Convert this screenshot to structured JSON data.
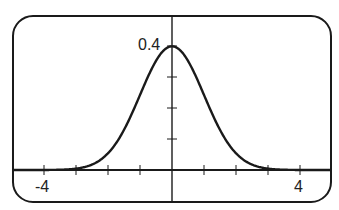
{
  "chart_data": {
    "type": "line",
    "title": "",
    "xlabel": "",
    "ylabel": "",
    "function": "standard normal probability density, y = (1/sqrt(2*pi)) * exp(-x^2/2)",
    "xlim": [
      -5,
      5
    ],
    "ylim": [
      -0.1,
      0.5
    ],
    "x_ticks": [
      -4,
      -3,
      -2,
      -1,
      0,
      1,
      2,
      3,
      4
    ],
    "y_ticks": [
      0.1,
      0.2,
      0.3,
      0.4
    ],
    "tick_labels": {
      "x_min": "-4",
      "x_max": "4",
      "y_max": "0.4"
    },
    "grid": false,
    "legend": null,
    "series": [
      {
        "name": "N(0,1) density",
        "x": [
          -5,
          -4,
          -3.5,
          -3,
          -2.5,
          -2,
          -1.5,
          -1,
          -0.5,
          0,
          0.5,
          1,
          1.5,
          2,
          2.5,
          3,
          3.5,
          4,
          5
        ],
        "y": [
          0.0,
          0.0001,
          0.0009,
          0.0044,
          0.0175,
          0.054,
          0.1295,
          0.242,
          0.3521,
          0.3989,
          0.3521,
          0.242,
          0.1295,
          0.054,
          0.0175,
          0.0044,
          0.0009,
          0.0001,
          0.0
        ]
      }
    ]
  },
  "labels": {
    "y_peak": "0.4",
    "x_left": "-4",
    "x_right": "4"
  },
  "style": {
    "line_color": "#1a1a1a",
    "frame_color": "#1a1a1a",
    "background": "#ffffff"
  }
}
